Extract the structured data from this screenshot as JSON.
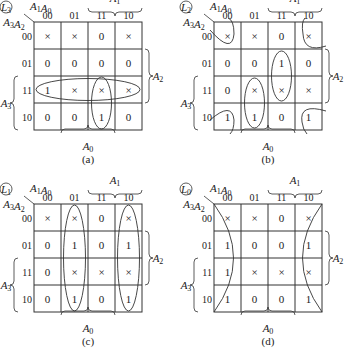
{
  "figure": {
    "col_headers": [
      "00",
      "01",
      "11",
      "10"
    ],
    "row_headers": [
      "00",
      "01",
      "11",
      "10"
    ],
    "col_var_label": "A1A0",
    "row_var_label": "A3A2",
    "brace_labels": {
      "top": "A1",
      "right": "A2",
      "left": "A3",
      "bottom": "A0"
    },
    "maps": [
      {
        "id": "a",
        "output": "L3",
        "caption": "(a)",
        "origin": [
          34,
          22
        ],
        "cells": [
          [
            "×",
            "×",
            "0",
            "×"
          ],
          [
            "0",
            "0",
            "0",
            "0"
          ],
          [
            "1",
            "×",
            "×",
            "×"
          ],
          [
            "0",
            "0",
            "1",
            "0"
          ]
        ],
        "groups": [
          "row-11 horizontal loop",
          "col-11 rows 11-10 vertical loop"
        ]
      },
      {
        "id": "b",
        "output": "L2",
        "caption": "(b)",
        "origin": [
          214,
          22
        ],
        "cells": [
          [
            "×",
            "×",
            "0",
            "×"
          ],
          [
            "0",
            "0",
            "1",
            "0"
          ],
          [
            "0",
            "×",
            "×",
            "×"
          ],
          [
            "1",
            "1",
            "0",
            "1"
          ]
        ],
        "groups": [
          "four corners",
          "col-11 rows 01-11",
          "col-01 rows 11-10"
        ]
      },
      {
        "id": "c",
        "output": "L1",
        "caption": "(c)",
        "origin": [
          34,
          204
        ],
        "cells": [
          [
            "×",
            "×",
            "0",
            "×"
          ],
          [
            "0",
            "1",
            "0",
            "1"
          ],
          [
            "0",
            "×",
            "×",
            "×"
          ],
          [
            "0",
            "1",
            "0",
            "1"
          ]
        ],
        "groups": [
          "col-01 full column",
          "col-10 full column"
        ]
      },
      {
        "id": "d",
        "output": "L0",
        "caption": "(d)",
        "origin": [
          214,
          204
        ],
        "cells": [
          [
            "×",
            "×",
            "0",
            "×"
          ],
          [
            "1",
            "0",
            "0",
            "1"
          ],
          [
            "1",
            "×",
            "×",
            "×"
          ],
          [
            "1",
            "0",
            "0",
            "1"
          ]
        ],
        "groups": [
          "col-00 and col-10 wrap-around"
        ]
      }
    ]
  }
}
